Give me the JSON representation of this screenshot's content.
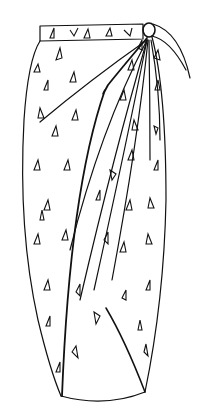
{
  "image": {
    "subject": "sarong wrap skirt line drawing",
    "background": "#ffffff",
    "stroke": "#111111",
    "pattern": "triangles"
  }
}
